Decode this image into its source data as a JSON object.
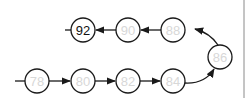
{
  "diagram": {
    "type": "linked-list-path",
    "colors": {
      "stroke": "#1a1a1a",
      "faint_label": "#d8d8d8",
      "highlight_label": "#111111",
      "border": "#8a8a8a"
    },
    "nodes": [
      {
        "id": "n0",
        "label": "78",
        "cx": 37,
        "cy": 81,
        "highlight": false
      },
      {
        "id": "n1",
        "label": "80",
        "cx": 83,
        "cy": 81,
        "highlight": false
      },
      {
        "id": "n2",
        "label": "82",
        "cx": 128,
        "cy": 81,
        "highlight": false
      },
      {
        "id": "n3",
        "label": "84",
        "cx": 173,
        "cy": 81,
        "highlight": false
      },
      {
        "id": "n4",
        "label": "86",
        "cx": 220,
        "cy": 57,
        "highlight": false
      },
      {
        "id": "n5",
        "label": "88",
        "cx": 173,
        "cy": 30,
        "highlight": false
      },
      {
        "id": "n6",
        "label": "90",
        "cx": 128,
        "cy": 30,
        "highlight": false
      },
      {
        "id": "n7",
        "label": "92",
        "cx": 83,
        "cy": 30,
        "highlight": true
      }
    ],
    "edges": [
      {
        "from": "n0",
        "to": "n1"
      },
      {
        "from": "n1",
        "to": "n2"
      },
      {
        "from": "n2",
        "to": "n3"
      },
      {
        "from": "n3",
        "to": "n4",
        "curved": true
      },
      {
        "from": "n4",
        "to": "n5",
        "curved": true
      },
      {
        "from": "n5",
        "to": "n6"
      },
      {
        "from": "n6",
        "to": "n7"
      }
    ],
    "entry_stub": {
      "node": "n0",
      "side": "left"
    },
    "exit_stub": {
      "node": "n7",
      "side": "left"
    }
  }
}
